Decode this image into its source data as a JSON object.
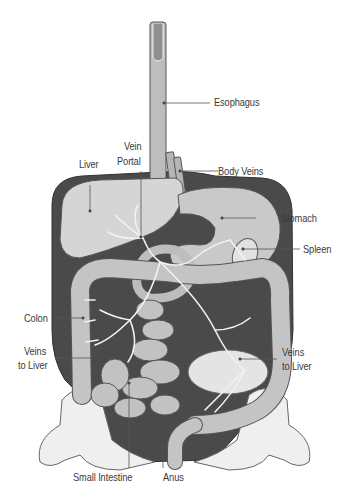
{
  "diagram": {
    "colors": {
      "background": "#ffffff",
      "cavity": "#4a4a4a",
      "organ_fill": "#c9c9c9",
      "organ_light": "#dedede",
      "organ_stroke": "#555555",
      "vein": "#f2f2f2",
      "bone": "#efefef",
      "leader": "#555555",
      "label_text": "#3a3a3a"
    },
    "labels": {
      "esophagus": "Esophagus",
      "vein_portal_1": "Vein",
      "vein_portal_2": "Portal",
      "liver": "Liver",
      "body_veins": "Body Veins",
      "stomach": "Stomach",
      "spleen": "Spleen",
      "colon": "Colon",
      "veins_to_liver_left_1": "Veins",
      "veins_to_liver_left_2": "to Liver",
      "veins_to_liver_right_1": "Veins",
      "veins_to_liver_right_2": "to Liver",
      "small_intestine": "Small Intestine",
      "anus": "Anus"
    }
  }
}
